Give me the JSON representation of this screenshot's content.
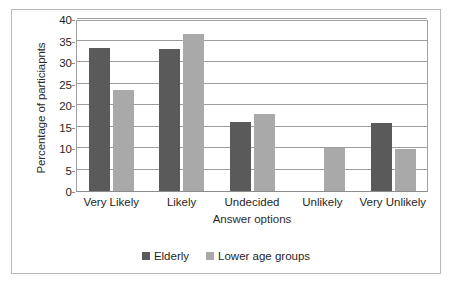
{
  "figure": {
    "border_color": "#b9b9b9",
    "background": "#ffffff"
  },
  "caption": {
    "text": ""
  },
  "chart_data": {
    "type": "bar",
    "title": "",
    "xlabel": "Answer options",
    "ylabel": "Percentage of particiapnts",
    "categories": [
      "Very Likely",
      "Likely",
      "Undecided",
      "Unlikely",
      "Very Unlikely"
    ],
    "series": [
      {
        "name": "Elderly",
        "color": "#5a5a5a",
        "values": [
          33.2,
          33.0,
          16.1,
          0,
          15.8
        ]
      },
      {
        "name": "Lower age groups",
        "color": "#a9a9a9",
        "values": [
          23.5,
          36.5,
          17.8,
          9.9,
          9.8
        ]
      }
    ],
    "ylim": [
      0,
      40
    ],
    "yticks": [
      0,
      5,
      10,
      15,
      20,
      25,
      30,
      35,
      40
    ],
    "ytick_labels": [
      "0",
      "5",
      "10",
      "15",
      "20",
      "25",
      "30",
      "35",
      "40"
    ],
    "grid": true,
    "grid_axis": "y",
    "legend_position": "bottom"
  }
}
